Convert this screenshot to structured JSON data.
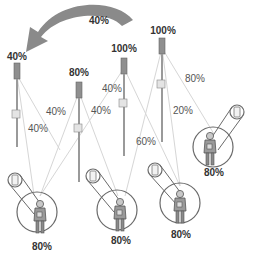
{
  "arrow": {
    "label": "40%",
    "color": "#8a8a8a"
  },
  "poles": [
    {
      "id": "pole-1",
      "label": "40%",
      "x": 17,
      "label_y": 56
    },
    {
      "id": "pole-2",
      "label": "80%",
      "x": 79,
      "label_y": 72
    },
    {
      "id": "pole-3",
      "label": "100%",
      "x": 124,
      "label_y": 47
    },
    {
      "id": "pole-4",
      "label": "100%",
      "x": 162,
      "label_y": 30
    }
  ],
  "links": [
    {
      "label": "40%"
    },
    {
      "label": "40%"
    },
    {
      "label": "40%"
    },
    {
      "label": "40%"
    },
    {
      "label": "40%"
    },
    {
      "label": "60%"
    },
    {
      "label": "80%"
    },
    {
      "label": "20%"
    }
  ],
  "users": [
    {
      "id": "user-1",
      "label": "80%"
    },
    {
      "id": "user-2",
      "label": "80%"
    },
    {
      "id": "user-3",
      "label": "80%"
    },
    {
      "id": "user-4",
      "label": "80%"
    }
  ],
  "colors": {
    "pole": "#8f8f8f",
    "line": "#d0d0d0",
    "circle": "#6a6a6a",
    "text_bold": "#333333",
    "text": "#555555"
  }
}
